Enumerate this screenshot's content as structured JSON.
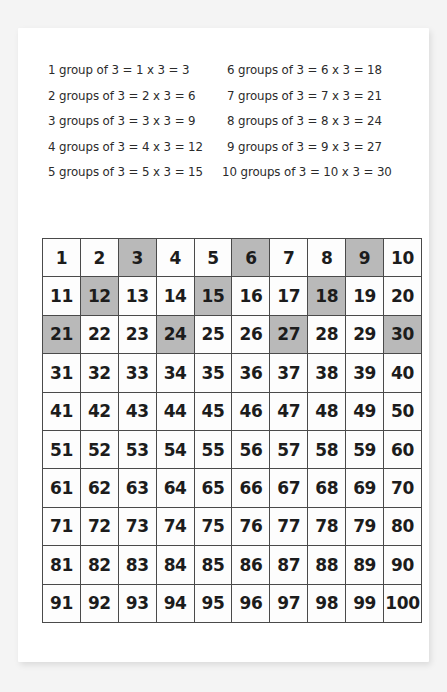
{
  "worksheet": {
    "equations": {
      "left_column": [
        "1 group of 3  = 1 x 3 = 3",
        "2 groups of 3  = 2 x 3 = 6",
        "3 groups of 3  = 3 x 3 = 9",
        "4 groups of 3  = 4 x 3 = 12",
        "5 groups of 3  = 5 x 3 = 15"
      ],
      "right_column": [
        "6 groups of 3 = 6 x 3 = 18",
        "7 groups of 3 = 7 x 3 = 21",
        "8 groups of 3 = 8 x 3 = 24",
        "9 groups of 3 = 9 x 3 = 27",
        "10 groups of 3 = 10 x 3 = 30"
      ]
    },
    "grid": {
      "rows": [
        [
          1,
          2,
          3,
          4,
          5,
          6,
          7,
          8,
          9,
          10
        ],
        [
          11,
          12,
          13,
          14,
          15,
          16,
          17,
          18,
          19,
          20
        ],
        [
          21,
          22,
          23,
          24,
          25,
          26,
          27,
          28,
          29,
          30
        ],
        [
          31,
          32,
          33,
          34,
          35,
          36,
          37,
          38,
          39,
          40
        ],
        [
          41,
          42,
          43,
          44,
          45,
          46,
          47,
          48,
          49,
          50
        ],
        [
          51,
          52,
          53,
          54,
          55,
          56,
          57,
          58,
          59,
          60
        ],
        [
          61,
          62,
          63,
          64,
          65,
          66,
          67,
          68,
          69,
          70
        ],
        [
          71,
          72,
          73,
          74,
          75,
          76,
          77,
          78,
          79,
          80
        ],
        [
          81,
          82,
          83,
          84,
          85,
          86,
          87,
          88,
          89,
          90
        ],
        [
          91,
          92,
          93,
          94,
          95,
          96,
          97,
          98,
          99,
          100
        ]
      ],
      "highlighted_values": [
        3,
        6,
        9,
        12,
        15,
        18,
        21,
        24,
        27,
        30
      ],
      "highlight_color": "#b9b9b9",
      "cell_background_color": "#fdfdfd",
      "border_color": "#4a4a4a"
    },
    "colors": {
      "page_background": "#f4f4f4",
      "card_background": "#ffffff",
      "text_color": "#2b2b2b"
    }
  }
}
